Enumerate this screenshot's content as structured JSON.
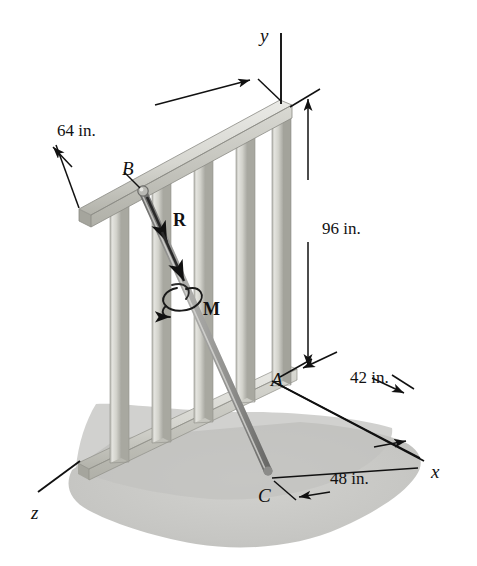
{
  "figure": {
    "background_color": "#ffffff"
  },
  "dimensions": [
    {
      "id": "top-rail-length",
      "text": "64 in.",
      "x": 57,
      "y": 122
    },
    {
      "id": "wall-height",
      "text": "96 in.",
      "x": 322,
      "y": 220
    },
    {
      "id": "a-to-x-offset",
      "text": "42 in.",
      "x": 350,
      "y": 369
    },
    {
      "id": "c-to-x-offset",
      "text": "48 in.",
      "x": 330,
      "y": 470
    }
  ],
  "points": [
    {
      "id": "point-b",
      "text": "B",
      "x": 122,
      "y": 159
    },
    {
      "id": "point-a",
      "text": "A",
      "x": 271,
      "y": 370
    },
    {
      "id": "point-c",
      "text": "C",
      "x": 258,
      "y": 486
    }
  ],
  "axes": [
    {
      "id": "axis-y",
      "text": "y",
      "x": 260,
      "y": 26
    },
    {
      "id": "axis-x",
      "text": "x",
      "x": 431,
      "y": 462
    },
    {
      "id": "axis-z",
      "text": "z",
      "x": 31,
      "y": 503
    }
  ],
  "loads": [
    {
      "id": "force-r",
      "text": "R",
      "x": 173,
      "y": 211
    },
    {
      "id": "moment-m",
      "text": "M",
      "x": 203,
      "y": 300
    }
  ],
  "colors": {
    "line": "#111111",
    "wood_light": "#e2e2de",
    "wood_mid": "#cfcfc9",
    "wood_dark": "#b4b4ad",
    "wood_edge": "#8f8f88",
    "ground": "#c9c9c6",
    "ground_shadow": "#b9b9b6",
    "rod_light": "#b6b6b3",
    "rod_dark": "#848482"
  },
  "geometry": {
    "units": "inches",
    "wall_height": 96,
    "top_rail_length": 64,
    "offset_a_x": 42,
    "offset_c_x": 48
  }
}
